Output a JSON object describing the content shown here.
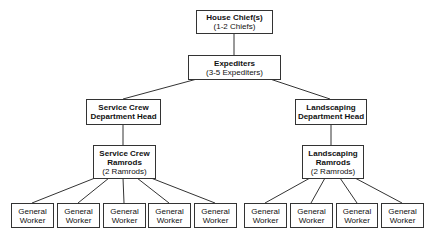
{
  "nodes": {
    "house_chief": {
      "title": "House Chief(s)",
      "sub": "(1-2 Chiefs)"
    },
    "expediters": {
      "title": "Expediters",
      "sub": "(3-5 Expediters)"
    },
    "service_head": {
      "title1": "Service Crew",
      "title2": "Department Head"
    },
    "landscaping_head": {
      "title1": "Landscaping",
      "title2": "Department Head"
    },
    "service_ramrods": {
      "title1": "Service Crew",
      "title2": "Ramrods",
      "sub": "(2 Ramrods)"
    },
    "landscaping_ramrods": {
      "title1": "Landscaping",
      "title2": "Ramrods",
      "sub": "(2 Ramrods)"
    }
  },
  "workers": {
    "service": [
      {
        "l1": "General",
        "l2": "Worker"
      },
      {
        "l1": "General",
        "l2": "Worker"
      },
      {
        "l1": "General",
        "l2": "Worker"
      },
      {
        "l1": "General",
        "l2": "Worker"
      },
      {
        "l1": "General",
        "l2": "Worker"
      }
    ],
    "landscaping": [
      {
        "l1": "General",
        "l2": "Worker"
      },
      {
        "l1": "General",
        "l2": "Worker"
      },
      {
        "l1": "General",
        "l2": "Worker"
      },
      {
        "l1": "General",
        "l2": "Worker"
      }
    ]
  }
}
